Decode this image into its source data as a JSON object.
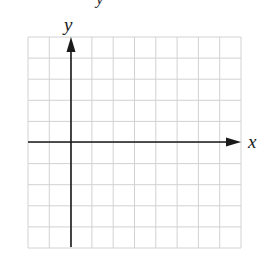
{
  "figure": {
    "type": "coordinate-grid",
    "axes": {
      "x_label": "x",
      "y_label": "y"
    },
    "grid": {
      "columns": 10,
      "rows": 10,
      "origin_column": 2,
      "origin_row": 5,
      "line_color": "#d2d2d2",
      "axis_color": "#1a1a1a"
    },
    "top_fragment_text": "y"
  }
}
